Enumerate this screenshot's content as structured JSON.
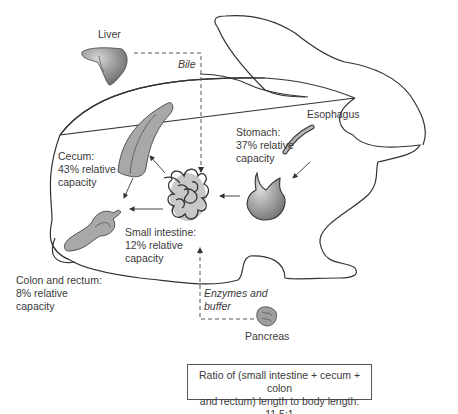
{
  "diagram": {
    "labels": {
      "liver": "Liver",
      "bile": "Bile",
      "esophagus": "Esophagus",
      "stomach": [
        "Stomach:",
        "37% relative",
        "capacity"
      ],
      "cecum": [
        "Cecum:",
        "43% relative",
        "capacity"
      ],
      "small_intestine": [
        "Small intestine:",
        "12% relative",
        "capacity"
      ],
      "colon_rectum": [
        "Colon and rectum:",
        "8% relative",
        "capacity"
      ],
      "enzymes": [
        "Enzymes and",
        "buffer"
      ],
      "pancreas": "Pancreas"
    },
    "ratio_note": [
      "Ratio of (small intestine + cecum + colon",
      "and rectum) length to body length: 11.5:1"
    ],
    "relative_capacity_percent": {
      "stomach": 37,
      "cecum": 43,
      "small_intestine": 12,
      "colon_and_rectum": 8
    },
    "colors": {
      "outline": "#333333",
      "organ_fill": "#a8a8a8",
      "organ_dark": "#6e6e6e"
    }
  }
}
